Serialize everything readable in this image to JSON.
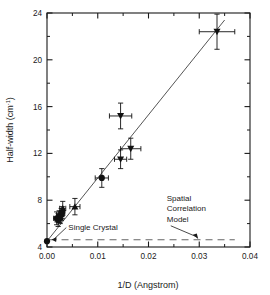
{
  "chart_data": {
    "type": "scatter",
    "title": "",
    "xlabel": "1/D (Angstrom)",
    "ylabel": "Half-width (cm-1)",
    "ylabel_main": "Half-width (cm",
    "ylabel_sup": "-1",
    "ylabel_tail": ")",
    "xlim": [
      0.0,
      0.04
    ],
    "ylim": [
      4,
      24
    ],
    "xticks": [
      0.0,
      0.01,
      0.02,
      0.03,
      0.04
    ],
    "xticklabels": [
      "0.00",
      "0.01",
      "0.02",
      "0.03",
      "0.04"
    ],
    "yticks": [
      4,
      8,
      12,
      16,
      20,
      24
    ],
    "yticklabels": [
      "4",
      "8",
      "12",
      "16",
      "20",
      "24"
    ],
    "xminor": [
      0.005,
      0.015,
      0.025,
      0.035
    ],
    "yminor": [
      6,
      10,
      14,
      18,
      22
    ],
    "grid": false,
    "legend": "none",
    "points": [
      {
        "x": 0.0,
        "y": 4.5,
        "marker": "circle",
        "xerr": 0.0,
        "yerr": 0.0
      },
      {
        "x": 0.0019,
        "y": 6.45,
        "marker": "circle",
        "xerr": 0.0006,
        "yerr": 0.55
      },
      {
        "x": 0.0022,
        "y": 6.3,
        "marker": "circle",
        "xerr": 0.0006,
        "yerr": 0.55
      },
      {
        "x": 0.0024,
        "y": 6.6,
        "marker": "circle",
        "xerr": 0.0005,
        "yerr": 0.5
      },
      {
        "x": 0.0026,
        "y": 6.5,
        "marker": "triangle-up",
        "xerr": 0.0005,
        "yerr": 0.5
      },
      {
        "x": 0.0028,
        "y": 6.8,
        "marker": "triangle-up",
        "xerr": 0.0005,
        "yerr": 0.5
      },
      {
        "x": 0.0031,
        "y": 7.3,
        "marker": "triangle-up",
        "xerr": 0.0006,
        "yerr": 0.6
      },
      {
        "x": 0.003,
        "y": 6.95,
        "marker": "circle",
        "xerr": 0.0005,
        "yerr": 0.5
      },
      {
        "x": 0.0055,
        "y": 7.45,
        "marker": "triangle-up",
        "xerr": 0.001,
        "yerr": 0.7
      },
      {
        "x": 0.0108,
        "y": 9.9,
        "marker": "circle",
        "xerr": 0.0013,
        "yerr": 0.8
      },
      {
        "x": 0.0145,
        "y": 11.5,
        "marker": "triangle-down",
        "xerr": 0.0012,
        "yerr": 0.8
      },
      {
        "x": 0.0165,
        "y": 12.4,
        "marker": "triangle-down",
        "xerr": 0.002,
        "yerr": 0.9
      },
      {
        "x": 0.0145,
        "y": 15.2,
        "marker": "triangle-down",
        "xerr": 0.0022,
        "yerr": 1.1
      },
      {
        "x": 0.0335,
        "y": 22.4,
        "marker": "triangle-down",
        "xerr": 0.0035,
        "yerr": 1.5
      }
    ],
    "fit_line": {
      "x0": 0.0,
      "y0": 4.5,
      "x1": 0.035,
      "y1": 23.4,
      "style": "solid"
    },
    "model_line": {
      "x0": 0.0005,
      "y0": 4.62,
      "x1": 0.037,
      "y1": 4.62,
      "style": "dashed"
    },
    "annotations": [
      {
        "name": "single-crystal",
        "text": "Single Crystal",
        "tx": 0.0042,
        "ty": 5.45,
        "ax": 0.0005,
        "ay": 4.55
      },
      {
        "name": "spatial-correlation-model",
        "line1": "Spatial",
        "line2": "Correlation",
        "line3": "Model",
        "tx": 0.0236,
        "ty": 7.95,
        "ax": 0.0296,
        "ay": 4.68
      }
    ]
  },
  "style": {
    "axis_color": "#1a1a1a",
    "marker_color": "#111111",
    "fit_color": "#555555",
    "model_color": "#666666",
    "bg": "#ffffff"
  }
}
